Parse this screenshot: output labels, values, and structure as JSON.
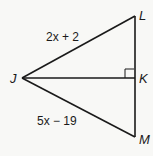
{
  "diagram": {
    "points": {
      "J": {
        "label": "J"
      },
      "K": {
        "label": "K"
      },
      "L": {
        "label": "L"
      },
      "M": {
        "label": "M"
      }
    },
    "segments": {
      "JL": {
        "expression": "2x + 2"
      },
      "JM": {
        "expression": "5x − 19"
      }
    },
    "right_angle_at": "K",
    "stroke_color": "#1a1a1a",
    "background": "#f8f8f6"
  }
}
